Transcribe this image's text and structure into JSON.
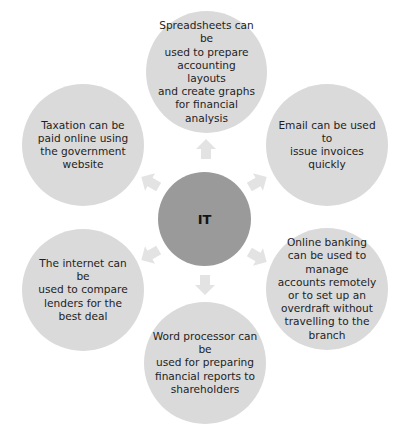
{
  "diagram": {
    "center": {
      "label": "IT",
      "color": "#9a9a9a"
    },
    "node_color": "#dadada",
    "arrow_color": "#e3e3e3",
    "nodes": [
      {
        "id": "spreadsheets",
        "text": "Spreadsheets can be used to prepare accounting layouts and create graphs for financial analysis",
        "lines": [
          "Spreadsheets can be",
          "used to prepare",
          "accounting layouts",
          "and create graphs",
          "for financial",
          "analysis"
        ]
      },
      {
        "id": "email",
        "text": "Email can be used to issue invoices quickly",
        "lines": [
          "Email can be used to",
          "issue invoices",
          "quickly"
        ]
      },
      {
        "id": "online-banking",
        "text": "Online banking can be used to manage accounts remotely or to set up an overdraft without travelling to the branch",
        "lines": [
          "Online banking",
          "can be used to manage",
          "accounts remotely",
          "or to set up an",
          "overdraft without",
          "travelling to the",
          "branch"
        ]
      },
      {
        "id": "word-processor",
        "text": "Word processor can be used for preparing financial reports to shareholders",
        "lines": [
          "Word processor can be",
          "used for preparing",
          "financial reports to",
          "shareholders"
        ]
      },
      {
        "id": "internet",
        "text": "The internet can be used to compare lenders for the best deal",
        "lines": [
          "The internet can be",
          "used to compare",
          "lenders for the",
          "best deal"
        ]
      },
      {
        "id": "taxation",
        "text": "Taxation can be paid online using the government website",
        "lines": [
          "Taxation can be",
          "paid online using",
          "the government",
          "website"
        ]
      }
    ]
  }
}
